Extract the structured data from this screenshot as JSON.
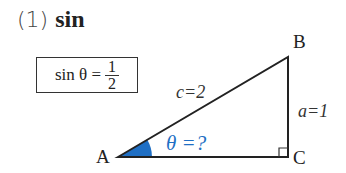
{
  "heading": {
    "number": "(1)",
    "function": "sin"
  },
  "formula": {
    "lhs": "sin θ =",
    "numerator": "1",
    "denominator": "2"
  },
  "triangle": {
    "vertices": [
      {
        "label": "A",
        "x": 118,
        "y": 157
      },
      {
        "label": "B",
        "x": 288,
        "y": 57
      },
      {
        "label": "C",
        "x": 288,
        "y": 157
      }
    ],
    "hypotenuse_label": "c=2",
    "opposite_label": "a=1",
    "angle_label": "θ =?",
    "right_angle_at": "C"
  },
  "colors": {
    "angle": "#1f6fc4",
    "stroke": "#222222"
  }
}
